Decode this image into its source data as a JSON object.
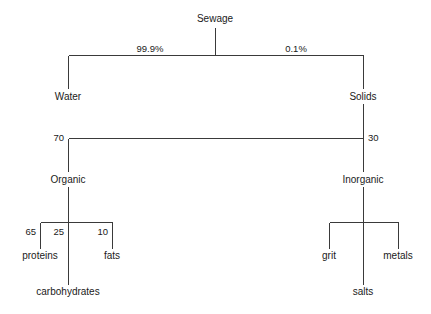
{
  "diagram": {
    "type": "tree",
    "background_color": "#ffffff",
    "line_color": "#3a3a3a",
    "text_color": "#1a1a1a",
    "nodes": {
      "sewage": {
        "label": "Sewage",
        "x": 215,
        "y": 22
      },
      "water": {
        "label": "Water",
        "x": 68,
        "y": 100
      },
      "solids": {
        "label": "Solids",
        "x": 363,
        "y": 100
      },
      "organic": {
        "label": "Organic",
        "x": 68,
        "y": 183
      },
      "inorganic": {
        "label": "Inorganic",
        "x": 363,
        "y": 183
      },
      "proteins": {
        "label": "proteins",
        "x": 40,
        "y": 259
      },
      "carbohydrates": {
        "label": "carbohydrates",
        "x": 68,
        "y": 295
      },
      "fats": {
        "label": "fats",
        "x": 112,
        "y": 259
      },
      "grit": {
        "label": "grit",
        "x": 329,
        "y": 259
      },
      "salts": {
        "label": "salts",
        "x": 363,
        "y": 295
      },
      "metals": {
        "label": "metals",
        "x": 398,
        "y": 259
      }
    },
    "edge_values": {
      "sewage_to_water": {
        "value": "99.9%",
        "x": 150,
        "y": 52
      },
      "sewage_to_solids": {
        "value": "0.1%",
        "x": 296,
        "y": 52
      },
      "solids_to_organic": {
        "value": "70",
        "x": 64,
        "y": 141
      },
      "solids_to_inorganic": {
        "value": "30",
        "x": 368,
        "y": 141
      },
      "organic_to_proteins": {
        "value": "65",
        "x": 36,
        "y": 235
      },
      "organic_to_carbs": {
        "value": "25",
        "x": 64,
        "y": 235
      },
      "organic_to_fats": {
        "value": "10",
        "x": 108,
        "y": 235
      }
    },
    "structure": {
      "level1_bar_y": 55,
      "level1_left_x": 68,
      "level1_right_x": 363,
      "level2_bar_y": 138,
      "organic_bar_y": 222,
      "organic_bar_left_x": 40,
      "organic_bar_right_x": 112,
      "inorganic_bar_y": 222,
      "inorganic_bar_left_x": 329,
      "inorganic_bar_right_x": 398
    }
  }
}
